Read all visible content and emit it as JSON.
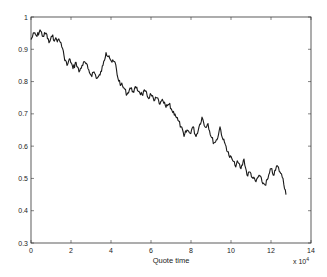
{
  "chart_data": {
    "type": "line",
    "title": "",
    "xlabel": "Quote time",
    "ylabel": "",
    "x_multiplier_label": "x 10^4",
    "xlim": [
      0,
      14
    ],
    "ylim": [
      0.3,
      1
    ],
    "grid": false,
    "legend": null,
    "x_ticks": [
      0,
      2,
      4,
      6,
      8,
      10,
      12,
      14
    ],
    "y_ticks": [
      0.3,
      0.4,
      0.5,
      0.6,
      0.7,
      0.8,
      0.9,
      1
    ],
    "x_tick_labels": [
      "0",
      "2",
      "4",
      "6",
      "8",
      "10",
      "12",
      "14"
    ],
    "y_tick_labels": [
      "0.3",
      "0.4",
      "0.5",
      "0.6",
      "0.7",
      "0.8",
      "0.9",
      "1"
    ],
    "series": [
      {
        "name": "price",
        "color": "#1a1a1a",
        "x": [
          0,
          0.15,
          0.3,
          0.45,
          0.6,
          0.75,
          0.9,
          1.05,
          1.2,
          1.35,
          1.5,
          1.65,
          1.8,
          1.95,
          2.1,
          2.25,
          2.4,
          2.55,
          2.7,
          2.85,
          3.0,
          3.15,
          3.3,
          3.45,
          3.6,
          3.75,
          3.9,
          4.05,
          4.2,
          4.35,
          4.5,
          4.65,
          4.8,
          4.95,
          5.1,
          5.25,
          5.4,
          5.55,
          5.7,
          5.85,
          6.0,
          6.15,
          6.3,
          6.45,
          6.6,
          6.75,
          6.9,
          7.05,
          7.2,
          7.35,
          7.5,
          7.65,
          7.8,
          7.95,
          8.1,
          8.25,
          8.4,
          8.55,
          8.7,
          8.85,
          9.0,
          9.15,
          9.3,
          9.45,
          9.6,
          9.75,
          9.9,
          10.05,
          10.2,
          10.35,
          10.5,
          10.65,
          10.8,
          10.95,
          11.1,
          11.25,
          11.4,
          11.55,
          11.7,
          11.85,
          12.0,
          12.15,
          12.3,
          12.45,
          12.6,
          12.75
        ],
        "y": [
          0.93,
          0.95,
          0.94,
          0.96,
          0.94,
          0.95,
          0.92,
          0.94,
          0.93,
          0.93,
          0.92,
          0.88,
          0.85,
          0.87,
          0.84,
          0.86,
          0.83,
          0.85,
          0.86,
          0.84,
          0.82,
          0.83,
          0.81,
          0.82,
          0.85,
          0.89,
          0.88,
          0.86,
          0.86,
          0.81,
          0.79,
          0.78,
          0.76,
          0.78,
          0.77,
          0.78,
          0.77,
          0.76,
          0.77,
          0.75,
          0.76,
          0.74,
          0.75,
          0.73,
          0.74,
          0.72,
          0.73,
          0.71,
          0.7,
          0.68,
          0.66,
          0.63,
          0.65,
          0.64,
          0.66,
          0.63,
          0.66,
          0.69,
          0.66,
          0.67,
          0.63,
          0.61,
          0.62,
          0.66,
          0.62,
          0.6,
          0.57,
          0.56,
          0.54,
          0.55,
          0.53,
          0.56,
          0.51,
          0.52,
          0.5,
          0.49,
          0.51,
          0.49,
          0.48,
          0.5,
          0.53,
          0.51,
          0.54,
          0.52,
          0.5,
          0.45
        ]
      }
    ]
  },
  "labels": {
    "xlabel": "Quote time",
    "x_multiplier": "x 10",
    "x_multiplier_exp": "4"
  }
}
